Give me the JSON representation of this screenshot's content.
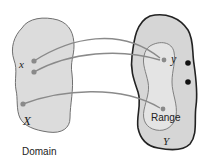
{
  "diagram": {
    "type": "function-mapping",
    "domain_set": {
      "label": "Domain",
      "set_name": "X",
      "element_label": "x"
    },
    "codomain_set": {
      "set_name": "Y",
      "element_label": "y",
      "range_label": "Range"
    },
    "arrows": [
      {
        "from": "x (upper point 1)",
        "to": "y"
      },
      {
        "from": "x (upper point 2)",
        "to": "y"
      },
      {
        "from": "lower point in X",
        "to": "range point"
      }
    ],
    "unmapped_points_in_Y": 2,
    "colors": {
      "set_fill": "#dcdcdc",
      "set_outline_domain": "#707070",
      "set_outline_codomain": "#222222",
      "range_fill": "#e6e6e6",
      "range_outline": "#808080",
      "arrow": "#808080",
      "point": "#8a8a8a",
      "unmapped_point": "#111111"
    }
  }
}
